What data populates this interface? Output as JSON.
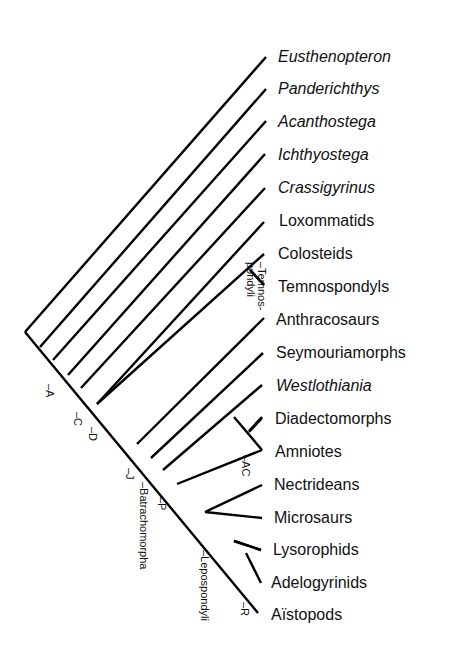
{
  "diagram": {
    "type": "cladogram",
    "stroke_color": "#000000",
    "taxa": [
      {
        "name": "Eusthenopteron",
        "italic": true,
        "x": 278,
        "y": 48
      },
      {
        "name": "Panderichthys",
        "italic": true,
        "x": 278,
        "y": 80
      },
      {
        "name": "Acanthostega",
        "italic": true,
        "x": 278,
        "y": 113
      },
      {
        "name": "Ichthyostega",
        "italic": true,
        "x": 278,
        "y": 146
      },
      {
        "name": "Crassigyrinus",
        "italic": true,
        "x": 278,
        "y": 179
      },
      {
        "name": "Loxommatids",
        "italic": false,
        "x": 279,
        "y": 212
      },
      {
        "name": "Colosteids",
        "italic": false,
        "x": 278,
        "y": 245
      },
      {
        "name": "Temnospondyls",
        "italic": false,
        "x": 278,
        "y": 278
      },
      {
        "name": "Anthracosaurs",
        "italic": false,
        "x": 276,
        "y": 311
      },
      {
        "name": "Seymouriamorphs",
        "italic": false,
        "x": 276,
        "y": 344
      },
      {
        "name": "Westlothiania",
        "italic": true,
        "x": 276,
        "y": 377
      },
      {
        "name": "Diadectomorphs",
        "italic": false,
        "x": 275,
        "y": 410
      },
      {
        "name": "Amniotes",
        "italic": false,
        "x": 275,
        "y": 443
      },
      {
        "name": "Nectrideans",
        "italic": false,
        "x": 274,
        "y": 476
      },
      {
        "name": "Microsaurs",
        "italic": false,
        "x": 274,
        "y": 509
      },
      {
        "name": "Lysorophids",
        "italic": false,
        "x": 273,
        "y": 541
      },
      {
        "name": "Adelogyrinids",
        "italic": false,
        "x": 271,
        "y": 574
      },
      {
        "name": "Aïstopods",
        "italic": false,
        "x": 271,
        "y": 606
      }
    ],
    "node_labels": [
      {
        "text": "–A",
        "x": 56,
        "y": 384
      },
      {
        "text": "–C",
        "x": 84,
        "y": 412
      },
      {
        "text": "–D",
        "x": 99,
        "y": 427
      },
      {
        "text": "–J",
        "x": 136,
        "y": 468
      },
      {
        "text": "–Batrachomorpha",
        "x": 150,
        "y": 482
      },
      {
        "text": "–P",
        "x": 168,
        "y": 497
      },
      {
        "text": "–Lepospondyli",
        "x": 211,
        "y": 550
      },
      {
        "text": "–R",
        "x": 251,
        "y": 602
      },
      {
        "text": "–AC",
        "x": 252,
        "y": 455
      },
      {
        "text": "–Temnos-",
        "x": 268,
        "y": 262
      },
      {
        "text": "pondyli",
        "x": 257,
        "y": 262
      }
    ],
    "branches": [
      {
        "from": [
          25,
          332
        ],
        "to": [
          258,
          613
        ]
      },
      {
        "from": [
          25,
          332
        ],
        "to": [
          266,
          57
        ]
      },
      {
        "from": [
          40,
          347
        ],
        "to": [
          266,
          89
        ]
      },
      {
        "from": [
          53,
          360
        ],
        "to": [
          266,
          121
        ]
      },
      {
        "from": [
          68,
          375
        ],
        "to": [
          265,
          154
        ]
      },
      {
        "from": [
          81,
          388
        ],
        "to": [
          265,
          188
        ]
      },
      {
        "from": [
          97,
          404
        ],
        "to": [
          264,
          222
        ]
      },
      {
        "from": [
          97,
          404
        ],
        "to": [
          264,
          254
        ]
      },
      {
        "from": [
          250,
          270
        ],
        "to": [
          264,
          285
        ]
      },
      {
        "from": [
          137,
          444
        ],
        "to": [
          264,
          318
        ]
      },
      {
        "from": [
          151,
          458
        ],
        "to": [
          263,
          353
        ]
      },
      {
        "from": [
          163,
          470
        ],
        "to": [
          262,
          385
        ]
      },
      {
        "from": [
          234,
          417
        ],
        "to": [
          262,
          450
        ]
      },
      {
        "from": [
          249,
          431
        ],
        "to": [
          262,
          417
        ]
      },
      {
        "from": [
          205,
          512
        ],
        "to": [
          262,
          485
        ]
      },
      {
        "from": [
          205,
          512
        ],
        "to": [
          262,
          518
        ]
      },
      {
        "from": [
          234,
          541
        ],
        "to": [
          261,
          550
        ]
      },
      {
        "from": [
          246,
          553
        ],
        "to": [
          261,
          583
        ]
      }
    ]
  }
}
